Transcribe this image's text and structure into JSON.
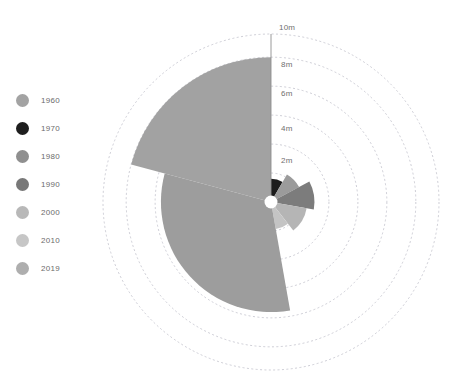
{
  "chart_data": {
    "type": "pie",
    "variant": "nightingale-rose-polar-area",
    "title": "",
    "subtitle": "",
    "xlabel": "",
    "ylabel": "",
    "radial_unit": "m",
    "radial_ticks": [
      "2m",
      "4m",
      "6m",
      "8m",
      "10m"
    ],
    "radial_tick_values": [
      2,
      4,
      6,
      8,
      10
    ],
    "rlim": [
      0,
      11.6
    ],
    "grid": true,
    "grid_style": "dashed-circles",
    "grid_color": "#b9b9c4",
    "legend_position": "left",
    "center_hole_label": "",
    "categories": [
      "1960",
      "1970",
      "1980",
      "1990",
      "2000",
      "2010",
      "2019"
    ],
    "series": [
      {
        "name": "value",
        "values": [
          10.0,
          1.6,
          2.2,
          3.0,
          2.5,
          1.9,
          7.6
        ]
      }
    ],
    "wedges": [
      {
        "category": "1960",
        "value": 10.0,
        "start_angle_deg": 285,
        "end_angle_deg": 360,
        "color": "#a2a2a2"
      },
      {
        "category": "1970",
        "value": 1.6,
        "start_angle_deg": 0,
        "end_angle_deg": 30,
        "color": "#1c1c1c"
      },
      {
        "category": "1980",
        "value": 2.2,
        "start_angle_deg": 30,
        "end_angle_deg": 62,
        "color": "#9b9b9b"
      },
      {
        "category": "1990",
        "value": 3.0,
        "start_angle_deg": 62,
        "end_angle_deg": 100,
        "color": "#7c7c7c"
      },
      {
        "category": "2000",
        "value": 2.5,
        "start_angle_deg": 100,
        "end_angle_deg": 142,
        "color": "#b5b5b5"
      },
      {
        "category": "2010",
        "value": 1.9,
        "start_angle_deg": 142,
        "end_angle_deg": 170,
        "color": "#c4c4c4"
      },
      {
        "category": "2019",
        "value": 7.6,
        "start_angle_deg": 170,
        "end_angle_deg": 285,
        "color": "#9d9d9d"
      }
    ]
  },
  "legend": {
    "items": [
      {
        "label": "1960",
        "color": "#a3a3a3"
      },
      {
        "label": "1970",
        "color": "#1e1e1e"
      },
      {
        "label": "1980",
        "color": "#8f8f8f"
      },
      {
        "label": "1990",
        "color": "#787878"
      },
      {
        "label": "2000",
        "color": "#b8b8b8"
      },
      {
        "label": "2010",
        "color": "#c6c6c6"
      },
      {
        "label": "2019",
        "color": "#aeaeae"
      }
    ]
  },
  "ticks": [
    {
      "label": "10m",
      "x": 279,
      "y": 23
    },
    {
      "label": "8m",
      "x": 281,
      "y": 60
    },
    {
      "label": "6m",
      "x": 281,
      "y": 89
    },
    {
      "label": "4m",
      "x": 281,
      "y": 124
    },
    {
      "label": "2m",
      "x": 281,
      "y": 156
    }
  ],
  "colors": {
    "background": "#ffffff",
    "grid": "#b9b9c4",
    "axis_line": "#8e8e8e",
    "center_dot": "#ffffff",
    "text": "#6b6b6b"
  }
}
